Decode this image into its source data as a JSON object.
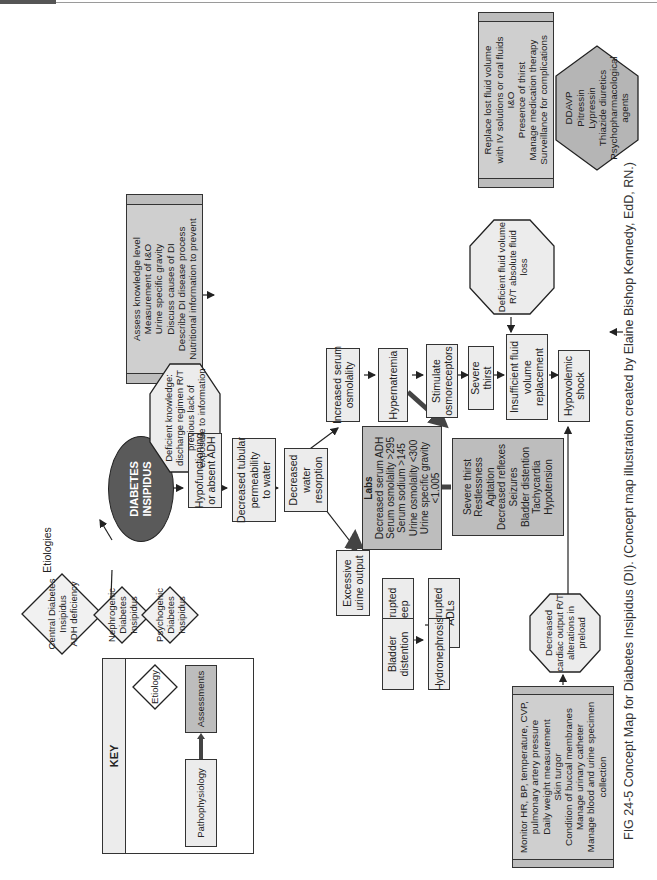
{
  "figure": {
    "label": "FIG 24-5",
    "title": "Concept Map for Diabetes Insipidus (DI).",
    "credit": "(Concept map illustration created by Elaine Bishop Kennedy, EdD, RN.)"
  },
  "central": {
    "lines": [
      "DIABETES",
      "INSIPIDUS"
    ]
  },
  "etiologies_label": "Etiologies",
  "etiologies": [
    {
      "lines": [
        "Central Diabetes",
        "Insipidus",
        "ADH deficiency"
      ]
    },
    {
      "lines": [
        "Nephrogenic",
        "Diabetes",
        "Insipidus"
      ]
    },
    {
      "lines": [
        "Psychogenic",
        "Diabetes",
        "Insipidus"
      ]
    }
  ],
  "pathophysiology": {
    "hypofunctioning": [
      "Hypofunctioning",
      "or absent ADH"
    ],
    "tubular": [
      "Decreased tubular",
      "permeability",
      "to water"
    ],
    "resorption": [
      "Decreased",
      "water",
      "resorption"
    ],
    "serum_osmolality": [
      "Increased serum",
      "osmolality"
    ],
    "hypernatremia": [
      "Hypernatremia"
    ],
    "osmoreceptors": [
      "Stimulate",
      "osmoreceptors"
    ],
    "severe_thirst": [
      "Severe thirst"
    ],
    "insufficient": [
      "Insufficient fluid",
      "volume",
      "replacement"
    ],
    "hypovolemic": [
      "Hypovolemic",
      "shock"
    ],
    "excessive_urine": [
      "Excessive",
      "urine output"
    ],
    "interrupted_sleep": [
      "Interrupted",
      "sleep"
    ],
    "interrupted_adls": [
      "Interrupted",
      "ADLs"
    ],
    "bladder": [
      "Bladder",
      "distention"
    ],
    "hydronephrosis": [
      "Hydronephrosis"
    ]
  },
  "assessments": {
    "labs": {
      "title": "Labs",
      "lines": [
        "Decreased serum ADH",
        "Serum osmolality >295",
        "Serum sodium >145",
        "Urine osmolality <300",
        "Urine specific gravity",
        "<1.005",
        "Urine output 1.0–1.5 L/hr."
      ]
    },
    "symptoms": {
      "lines": [
        "Severe thirst",
        "Restlessness",
        "Agitation",
        "Decreased reflexes",
        "Seizures",
        "Bladder distention",
        "Tachycardia",
        "Hypotension"
      ]
    }
  },
  "nursing_diagnoses": {
    "deficient_knowledge": [
      "Deficient knowledge:",
      "discharge regimen R/T",
      "previous lack of",
      "exposure to information"
    ],
    "deficient_fluid": [
      "Deficient fluid volume",
      "R/T absolute fluid",
      "loss"
    ],
    "decreased_cardiac": [
      "Decreased",
      "cardiac output R/T",
      "alterations in",
      "preload"
    ]
  },
  "nursing_interventions": {
    "knowledge": [
      "Assess knowledge level",
      "Measurement of I&O",
      "Urine specific gravity",
      "Discuss causes of DI",
      "Describe DI disease process",
      "Nutritional information to prevent",
      "constipation and diarrhea",
      "Medications: explain purpose, side",
      "effects, dosage and how often to use",
      "Identify signs and symptoms that",
      "should be reported to primary care",
      "practitioner"
    ],
    "fluid": [
      "Replace lost fluid volume",
      "with IV solutions or oral fluids",
      "I&O",
      "Presence of thirst",
      "Manage medication therapy",
      "Surveillance for complications"
    ],
    "cardiac": [
      "Monitor HR, BP, temperature, CVP,",
      "pulmonary artery pressure",
      "Daily weight measurement",
      "Skin turgor",
      "Condition of buccal membranes",
      "Manage urinary catheter",
      "Manage blood and urine specimen",
      "collection"
    ]
  },
  "medications": {
    "lines": [
      "DDAVP",
      "Pitressin",
      "Lypressin",
      "Thiazide diuretics",
      "Psychopharmacological",
      "agents"
    ]
  },
  "key": {
    "title": "KEY",
    "etiology": "Etiology",
    "assessments": "Assessments",
    "pathophysiology": "Pathophysiology",
    "nursing_diagnosis": [
      "Nursing",
      "Diagnosis"
    ],
    "nursing_interventions": [
      "Nursing",
      "Interventions"
    ],
    "medication": "Medication"
  },
  "colors": {
    "assessment_fill": "#bdbdbd",
    "box_fill": "#ececec",
    "central_fill": "#5a5a5a",
    "medication_fill": "#b5b5b5",
    "line": "#333333"
  }
}
